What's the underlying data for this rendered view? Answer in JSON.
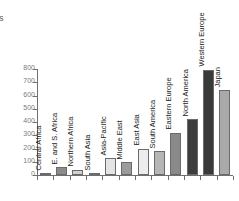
{
  "caption_fragment": "rs",
  "chart_data": {
    "type": "bar",
    "title": "",
    "subtitle": "",
    "xlabel": "",
    "ylabel": "",
    "ylim": [
      0,
      800
    ],
    "yticks": [
      0,
      100,
      200,
      300,
      400,
      500,
      600,
      700,
      800
    ],
    "ytick_labels": [
      "0",
      "100",
      "200",
      "300",
      "400",
      "500",
      "600",
      "700",
      "800"
    ],
    "grid": false,
    "legend": false,
    "legend_position": "none",
    "categories": [
      "Central Africa",
      "E. and S. Africa",
      "Northern Africa",
      "South Asia",
      "Asia-Pacific",
      "Middle East",
      "East Asia",
      "South America",
      "Eastern Europe",
      "North America",
      "Western Europe",
      "Japan"
    ],
    "values": [
      12,
      60,
      38,
      10,
      128,
      98,
      200,
      178,
      320,
      422,
      795,
      638
    ],
    "bar_colors": [
      "#8f8f8f",
      "#8c8c8c",
      "#d2d2d2",
      "#9a9a9a",
      "#e4e4e4",
      "#9b9b9b",
      "#ededed",
      "#b6b6b6",
      "#8a8a8a",
      "#3d3d3d",
      "#3a3a3a",
      "#a9a9a9"
    ],
    "axis_color": "#6f6f6f",
    "tick_label_color": "#7a7a7a",
    "category_label_color": "#1c1c1c"
  }
}
